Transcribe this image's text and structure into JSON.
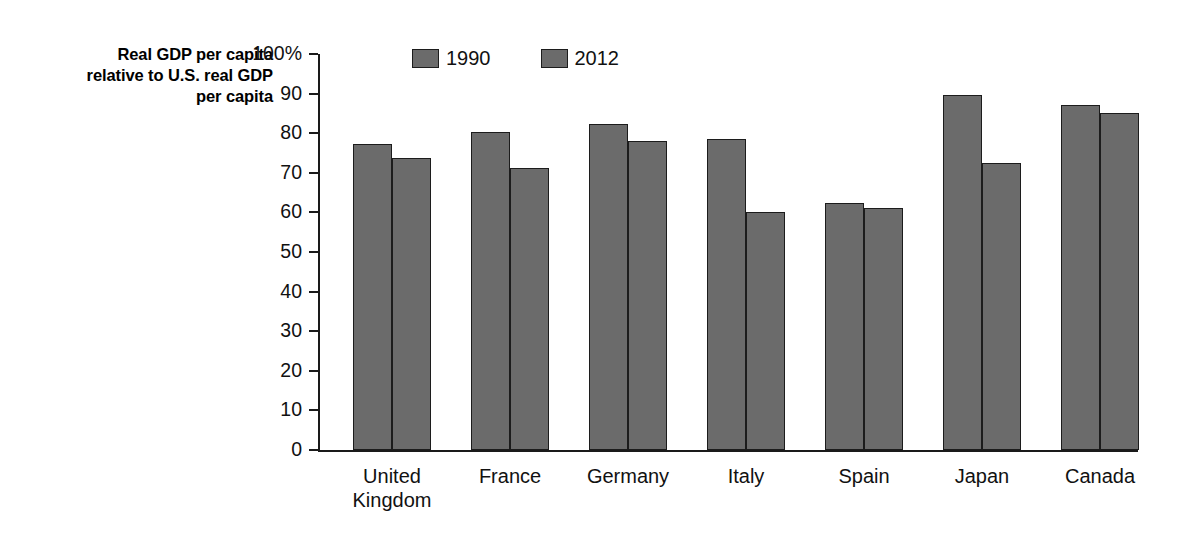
{
  "chart_data": {
    "type": "bar",
    "title": "",
    "subtitle": "",
    "xlabel": "",
    "ylabel": "Real GDP per capita relative to U.S. real GDP per capita",
    "ylabel_lines": [
      "Real GDP per capita",
      "relative to U.S. real GDP",
      "per capita"
    ],
    "ylim": [
      0,
      100
    ],
    "y_unit": "%",
    "y_ticks": [
      0,
      10,
      20,
      30,
      40,
      50,
      60,
      70,
      80,
      90,
      100
    ],
    "y_tick_labels": [
      "0",
      "10",
      "20",
      "30",
      "40",
      "50",
      "60",
      "70",
      "80",
      "90",
      "100%"
    ],
    "grid": false,
    "legend_position": "top-left-inside",
    "categories": [
      "United Kingdom",
      "France",
      "Germany",
      "Italy",
      "Spain",
      "Japan",
      "Canada"
    ],
    "category_label_lines": [
      [
        "United",
        "Kingdom"
      ],
      [
        "France"
      ],
      [
        "Germany"
      ],
      [
        "Italy"
      ],
      [
        "Spain"
      ],
      [
        "Japan"
      ],
      [
        "Canada"
      ]
    ],
    "series": [
      {
        "name": "1990",
        "color": "#6b6b6b",
        "values": [
          77.2,
          80.2,
          82.4,
          78.6,
          62.5,
          89.7,
          87.0
        ]
      },
      {
        "name": "2012",
        "color": "#6b6b6b",
        "values": [
          73.8,
          71.2,
          78.1,
          60.2,
          61.0,
          72.4,
          85.2
        ]
      }
    ]
  },
  "legend": {
    "entries": [
      {
        "label": "1990"
      },
      {
        "label": "2012"
      }
    ]
  },
  "colors": {
    "bar_fill": "#6b6b6b",
    "bar_stroke": "#1c1c1c",
    "axis": "#1a1a1a",
    "text": "#111111",
    "background": "#ffffff"
  }
}
